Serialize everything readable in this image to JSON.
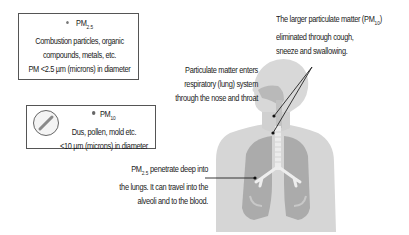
{
  "pm25_box": {
    "title": "PM",
    "title_sub": "2.5",
    "line1": "Combustion particles, organic",
    "line2": "compounds, metals, etc.",
    "line3": "PM <2.5 µm (microns) in diameter",
    "icon": "small-particle-dot-icon"
  },
  "pm10_box": {
    "title": "PM",
    "title_sub": "10",
    "line1": "Dus, pollen, mold etc.",
    "line2": "<10 µm (microns) in diameter",
    "icon": "magnified-particle-icon"
  },
  "notes": {
    "top_right": {
      "line1_pre": "The larger particulate matter (PM",
      "line1_sub": "10",
      "line1_post": ")",
      "line2": "eliminated through cough,",
      "line3": "sneeze and swallowing."
    },
    "entry": {
      "line1": "Particulate matter enters",
      "line2": "respiratory (lung) system",
      "line3": "through the nose and throat"
    },
    "lungs": {
      "line1_pre": "PM",
      "line1_sub": "2.5",
      "line1_post": " penetrate deep into",
      "line2": "the lungs. It can travel into the",
      "line3": "alveoli and to the blood."
    }
  },
  "figure": {
    "colors": {
      "body": "#d3d3d3",
      "body_shade": "#c4c4c4",
      "lungs": "#a9a9a9",
      "airway": "#b5b5b5",
      "trachea": "#e8e8e8",
      "pointer": "#222222"
    }
  }
}
